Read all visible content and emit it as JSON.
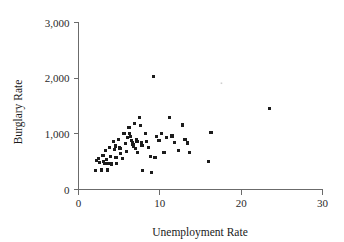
{
  "chart_data": {
    "type": "scatter",
    "title": "",
    "xlabel": "Unemployment Rate",
    "ylabel": "Burglary Rate",
    "xlim": [
      0,
      30
    ],
    "ylim": [
      0,
      3000
    ],
    "xticks": [
      0,
      10,
      20,
      30
    ],
    "yticks": [
      0,
      1000,
      2000,
      3000
    ],
    "xtick_labels": [
      "0",
      "10",
      "20",
      "30"
    ],
    "ytick_labels": [
      "0",
      "1,000",
      "2,000",
      "3,000"
    ],
    "grid": false,
    "legend": null,
    "marker": "square",
    "marker_color": "#1c1c1c",
    "points": [
      [
        2.1,
        340
      ],
      [
        2.2,
        520
      ],
      [
        2.5,
        555
      ],
      [
        2.6,
        480
      ],
      [
        2.8,
        350
      ],
      [
        3.0,
        610
      ],
      [
        3.1,
        500
      ],
      [
        3.2,
        470
      ],
      [
        3.3,
        700
      ],
      [
        3.4,
        540
      ],
      [
        3.5,
        460
      ],
      [
        3.6,
        350
      ],
      [
        3.8,
        760
      ],
      [
        3.9,
        600
      ],
      [
        4.0,
        470
      ],
      [
        4.1,
        455
      ],
      [
        4.3,
        860
      ],
      [
        4.4,
        720
      ],
      [
        4.5,
        780
      ],
      [
        4.6,
        580
      ],
      [
        4.7,
        470
      ],
      [
        4.9,
        900
      ],
      [
        5.0,
        755
      ],
      [
        5.1,
        735
      ],
      [
        5.2,
        640
      ],
      [
        5.4,
        560
      ],
      [
        5.6,
        1010
      ],
      [
        5.8,
        830
      ],
      [
        5.9,
        680
      ],
      [
        6.0,
        930
      ],
      [
        6.2,
        1120
      ],
      [
        6.3,
        1000
      ],
      [
        6.4,
        955
      ],
      [
        6.5,
        880
      ],
      [
        6.6,
        845
      ],
      [
        6.7,
        810
      ],
      [
        6.8,
        775
      ],
      [
        6.9,
        1180
      ],
      [
        7.0,
        740
      ],
      [
        7.1,
        905
      ],
      [
        7.2,
        860
      ],
      [
        7.3,
        660
      ],
      [
        7.5,
        1295
      ],
      [
        7.6,
        1145
      ],
      [
        7.7,
        845
      ],
      [
        7.8,
        790
      ],
      [
        7.9,
        340
      ],
      [
        8.2,
        1000
      ],
      [
        8.4,
        860
      ],
      [
        8.6,
        760
      ],
      [
        8.9,
        590
      ],
      [
        9.0,
        305
      ],
      [
        9.2,
        2030
      ],
      [
        9.4,
        580
      ],
      [
        9.6,
        950
      ],
      [
        9.9,
        875
      ],
      [
        10.2,
        1010
      ],
      [
        10.5,
        660
      ],
      [
        10.8,
        930
      ],
      [
        11.2,
        1300
      ],
      [
        11.5,
        960
      ],
      [
        11.8,
        840
      ],
      [
        12.3,
        700
      ],
      [
        12.8,
        1160
      ],
      [
        13.1,
        905
      ],
      [
        13.4,
        835
      ],
      [
        13.6,
        665
      ],
      [
        16.0,
        510
      ],
      [
        16.3,
        1020
      ],
      [
        23.5,
        1450
      ]
    ],
    "faint_specks": [
      [
        17.6,
        1905
      ]
    ]
  }
}
